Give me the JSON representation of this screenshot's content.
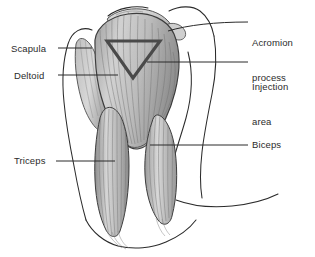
{
  "figure": {
    "background_color": "#ffffff",
    "line_color": "#2b2b2b",
    "text_color": "#2b2b2b",
    "muscle_fill": "#b9b9b9",
    "scapula_fill": "#c9c9c9",
    "marker_color": "#4a4a4a"
  },
  "labels": {
    "scapula": "Scapula",
    "deltoid": "Deltoid",
    "triceps": "Triceps",
    "acromion_line1": "Acromion",
    "acromion_line2": "process",
    "injection_line1": "Injection",
    "injection_line2": "area",
    "biceps": "Biceps"
  },
  "markers": {
    "injection_triangle": {
      "shape": "inverted-triangle",
      "description": "downward pointing triangle outlining the safe injection zone over the deltoid"
    }
  }
}
